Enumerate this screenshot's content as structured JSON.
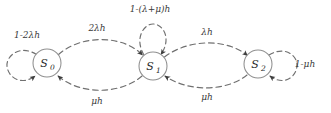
{
  "diagram": {
    "type": "markov-chain-state-transition-diagram",
    "background_color": "#ffffff",
    "node_stroke_color": "#8a8a8a",
    "edge_color": "#707070",
    "text_color": "#2b2b2b",
    "states": [
      {
        "id": "s0",
        "name": "S",
        "subscript": "0",
        "cx": 47,
        "cy": 63,
        "r": 14
      },
      {
        "id": "s1",
        "name": "S",
        "subscript": "1",
        "cx": 153,
        "cy": 66,
        "r": 14
      },
      {
        "id": "s2",
        "name": "S",
        "subscript": "2",
        "cx": 258,
        "cy": 64,
        "r": 14
      }
    ],
    "self_loops": [
      {
        "id": "loop-s0",
        "from": "s0",
        "to": "s0",
        "position": "left",
        "label_plain": "1-2λh",
        "label_lead": "1",
        "label_op": "−",
        "label_rate": "2λh",
        "label_x": 27,
        "label_y": 38
      },
      {
        "id": "loop-s1",
        "from": "s1",
        "to": "s1",
        "position": "top",
        "label_plain": "1-(λ+μ)h",
        "label_lead": "1",
        "label_op": "−",
        "label_rate": "(λ+μ)h",
        "label_x": 150,
        "label_y": 12
      },
      {
        "id": "loop-s2",
        "from": "s2",
        "to": "s2",
        "position": "right",
        "label_plain": "1-μh",
        "label_lead": "1",
        "label_op": "−",
        "label_rate": "μh",
        "label_x": 305,
        "label_y": 67
      }
    ],
    "transitions": [
      {
        "id": "t-s0-s1",
        "from": "s0",
        "to": "s1",
        "arc": "upper",
        "label": "2λh",
        "label_x": 97,
        "label_y": 31
      },
      {
        "id": "t-s1-s0",
        "from": "s1",
        "to": "s0",
        "arc": "lower",
        "label": "μh",
        "label_x": 97,
        "label_y": 104
      },
      {
        "id": "t-s1-s2",
        "from": "s1",
        "to": "s2",
        "arc": "upper",
        "label": "λh",
        "label_x": 207,
        "label_y": 35
      },
      {
        "id": "t-s2-s1",
        "from": "s2",
        "to": "s1",
        "arc": "lower",
        "label": "μh",
        "label_x": 207,
        "label_y": 100
      }
    ]
  }
}
